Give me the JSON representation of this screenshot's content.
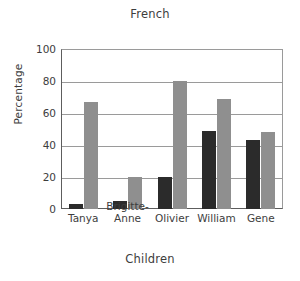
{
  "chart_data": {
    "type": "bar",
    "title": "French",
    "xlabel": "Children",
    "ylabel": "Percentage",
    "categories": [
      "Tanya",
      "Brigitte-Anne",
      "Olivier",
      "William",
      "Gene"
    ],
    "category_lines": [
      [
        "Tanya"
      ],
      [
        "Brigitte-",
        "Anne"
      ],
      [
        "Olivier"
      ],
      [
        "William"
      ],
      [
        "Gene"
      ]
    ],
    "series": [
      {
        "name": "dark",
        "color": "#2b2b2b",
        "values": [
          3,
          5,
          20,
          49,
          43
        ]
      },
      {
        "name": "light",
        "color": "#8f8f8f",
        "values": [
          67,
          20,
          80,
          69,
          48
        ]
      }
    ],
    "ylim": [
      0,
      100
    ],
    "yticks": [
      0,
      20,
      40,
      60,
      80,
      100
    ],
    "ytick_labels": [
      "0",
      "20",
      "40",
      "60",
      "80",
      "100"
    ],
    "grid": true,
    "legend": "none",
    "legend_position": "none",
    "bar_width_px": 14,
    "axis_color": "#5d5d5d",
    "grid_color": "#9a9a9a",
    "text_color": "#3d3d3d",
    "background": "#ffffff"
  }
}
